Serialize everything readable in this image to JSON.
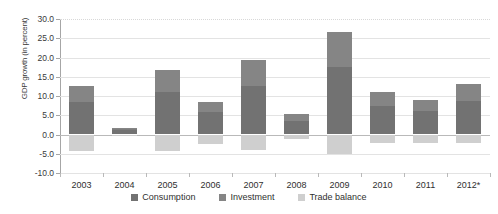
{
  "chart_data": {
    "type": "bar",
    "stacked": true,
    "title": "",
    "xlabel": "",
    "ylabel": "GDP growth (in percent)",
    "categories": [
      "2003",
      "2004",
      "2005",
      "2006",
      "2007",
      "2008",
      "2009",
      "2010",
      "2011",
      "2012*"
    ],
    "ylim": [
      -10.0,
      30.0
    ],
    "ytick_values": [
      -10.0,
      -5.0,
      0.0,
      5.0,
      10.0,
      15.0,
      20.0,
      25.0,
      30.0
    ],
    "ytick_labels": [
      "-10.0",
      "-5.0",
      "0.0",
      "5.0",
      "10.0",
      "15.0",
      "20.0",
      "25.0",
      "30.0"
    ],
    "grid": true,
    "legend_position": "bottom",
    "series": [
      {
        "name": "Consumption",
        "color": "#727272",
        "values": [
          8.5,
          1.3,
          11.0,
          5.8,
          12.5,
          3.6,
          17.5,
          7.4,
          6.0,
          8.6
        ]
      },
      {
        "name": "Investment",
        "color": "#858585",
        "values": [
          4.2,
          0.5,
          5.7,
          2.7,
          6.8,
          1.7,
          9.2,
          3.6,
          3.0,
          4.4
        ]
      },
      {
        "name": "Trade balance",
        "color": "#cfcfcf",
        "values": [
          -4.2,
          -0.2,
          -4.3,
          -2.5,
          -4.0,
          -1.2,
          -5.0,
          -2.2,
          -2.3,
          -2.3
        ]
      }
    ],
    "bar_totals_positive": [
      12.7,
      1.8,
      16.7,
      8.5,
      19.3,
      5.3,
      26.7,
      11.0,
      9.0,
      13.0
    ]
  },
  "colors": {
    "consumption": "#727272",
    "investment": "#858585",
    "trade_balance": "#cfcfcf",
    "gridline": "#e3e3e3",
    "axis": "#a6a6a6",
    "background": "#ffffff"
  }
}
